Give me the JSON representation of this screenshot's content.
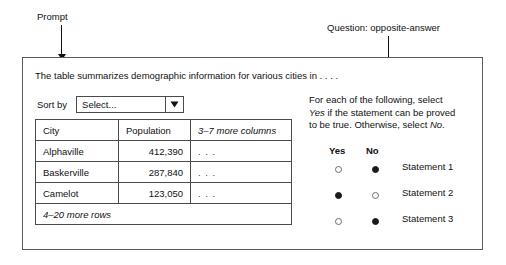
{
  "annotations": {
    "prompt_label": "Prompt",
    "question_label": "Question: opposite-answer"
  },
  "question": {
    "stem": "The table summarizes demographic information for various cities in . . . .",
    "sort": {
      "label": "Sort by",
      "selected": "Select...",
      "arrow_icon": "chevron-down-icon"
    },
    "table": {
      "columns": [
        "City",
        "Population",
        "3–7 more columns"
      ],
      "rows": [
        [
          "Alphaville",
          "412,390",
          ". . ."
        ],
        [
          "Baskerville",
          "287,840",
          ". . ."
        ],
        [
          "Camelot",
          "123,050",
          ". . ."
        ]
      ],
      "footer": "4–20 more rows"
    },
    "response": {
      "instructions_line1": "For each of the following, select",
      "instructions_line2_pre": "Yes",
      "instructions_line2_post": " if the statement can be proved",
      "instructions_line3_pre": "to be true. Otherwise, select ",
      "instructions_line3_em": "No",
      "instructions_line3_post": ".",
      "column_yes": "Yes",
      "column_no": "No",
      "statements": [
        {
          "label": "Statement 1",
          "yes_selected": false,
          "no_selected": true
        },
        {
          "label": "Statement 2",
          "yes_selected": true,
          "no_selected": false
        },
        {
          "label": "Statement 3",
          "yes_selected": false,
          "no_selected": true
        }
      ]
    }
  }
}
